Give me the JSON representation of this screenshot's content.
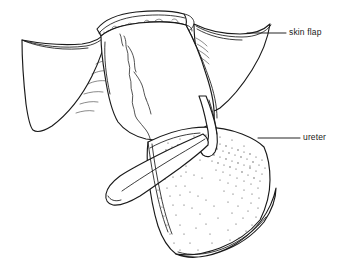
{
  "figure": {
    "background_color": "#ffffff",
    "line_color": "#1a1a1a",
    "stipple_color": "#4a4a4a",
    "width": 346,
    "height": 276
  },
  "labels": [
    {
      "id": "skin-flap",
      "text": "skin flap",
      "text_x": 289,
      "text_y": 33,
      "leader_from_x": 286,
      "leader_from_y": 33,
      "leader_to_x": 247,
      "leader_to_y": 33
    },
    {
      "id": "ureter",
      "text": "ureter",
      "text_x": 303,
      "text_y": 138,
      "leader_from_x": 300,
      "leader_from_y": 138,
      "leader_to_x": 258,
      "leader_to_y": 138
    }
  ],
  "structures": [
    {
      "id": "left-skin-flap",
      "name": "left skin flap"
    },
    {
      "id": "right-skin-flap",
      "name": "right skin flap"
    },
    {
      "id": "top-band",
      "name": "upper transverse band"
    },
    {
      "id": "central-body",
      "name": "central body"
    },
    {
      "id": "lower-left-flap",
      "name": "lower left flap"
    },
    {
      "id": "stippled-region",
      "name": "stippled lower region"
    },
    {
      "id": "ureter-tube",
      "name": "ureter tube"
    },
    {
      "id": "bottom-rim",
      "name": "bottom rim"
    }
  ]
}
